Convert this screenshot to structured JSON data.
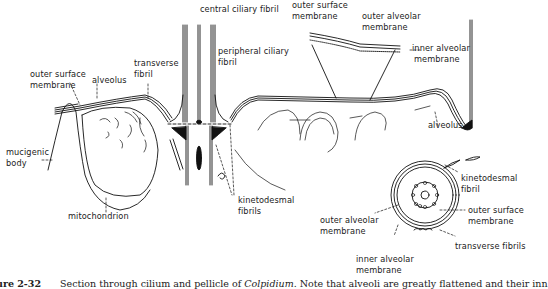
{
  "figure": {
    "caption_number": "ure 2-32",
    "caption_text_a": "Section through cilium and pellicle of ",
    "caption_italic": "Colpidium",
    "caption_text_b": ". Note that alveoli are greatly flattened and their inn"
  },
  "labels": {
    "central_ciliary_fibril": "central ciliary fibril",
    "peripheral_ciliary_fibril_1": "peripheral ciliary",
    "peripheral_ciliary_fibril_2": "fibril",
    "transverse_fibril_1": "transverse",
    "transverse_fibril_2": "fibril",
    "outer_surface_membrane_left_1": "outer surface",
    "outer_surface_membrane_left_2": "membrane",
    "alveolus_left": "alveolus",
    "mucigenic_body_1": "mucigenic",
    "mucigenic_body_2": "body",
    "mitochondrion": "mitochondrion",
    "kinetodesmal_fibrils_1": "kinetodesmal",
    "kinetodesmal_fibrils_2": "fibrils",
    "inset_outer_surface_membrane_1": "outer surface",
    "inset_outer_surface_membrane_2": "membrane",
    "inset_outer_alveolar_membrane_1": "outer alveolar",
    "inset_outer_alveolar_membrane_2": "membrane",
    "inset_inner_alveolar_membrane_1": "inner alveolar",
    "inset_inner_alveolar_membrane_2": "membrane",
    "alveolus_right": "alveolus",
    "cs_kinetodesmal_fibril_1": "kinetodesmal",
    "cs_kinetodesmal_fibril_2": "fibril",
    "cs_outer_surface_membrane_1": "outer surface",
    "cs_outer_surface_membrane_2": "membrane",
    "cs_outer_alveolar_membrane_1": "outer alveolar",
    "cs_outer_alveolar_membrane_2": "membrane",
    "cs_inner_alveolar_membrane_1": "inner alveolar",
    "cs_inner_alveolar_membrane_2": "membrane",
    "cs_transverse_fibrils": "transverse fibrils"
  }
}
